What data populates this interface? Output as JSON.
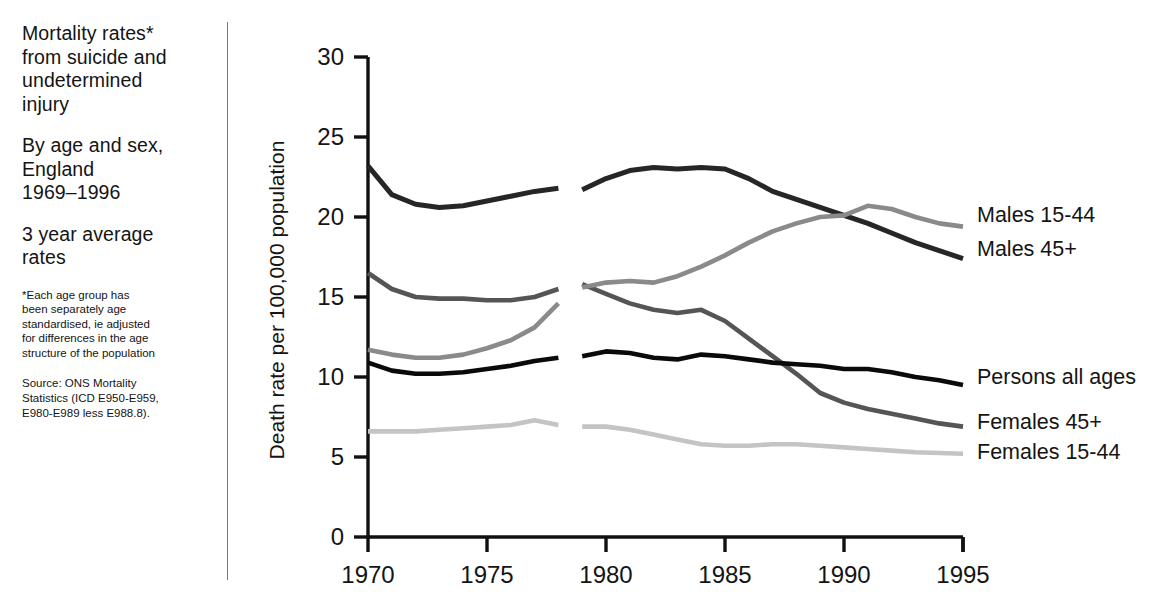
{
  "caption": {
    "title": "Mortality rates*\nfrom suicide and\nundetermined\ninjury",
    "subtitle": "By age and sex,\nEngland\n1969–1996",
    "note": "3 year average\nrates",
    "footnote_star": "*Each age group has\nbeen separately age\nstandardised, ie adjusted\nfor differences in the age\nstructure of the population",
    "footnote_source": "Source: ONS Mortality\nStatistics (ICD E950-E959,\nE980-E989 less E988.8)."
  },
  "chart_data": {
    "type": "line",
    "xlabel": "",
    "ylabel": "Death rate per 100,000 population",
    "xlim": [
      1969,
      1995.5
    ],
    "ylim": [
      0,
      30
    ],
    "xticks": [
      "1970",
      "1975",
      "1980",
      "1985",
      "1990",
      "1995"
    ],
    "xtick_values": [
      1970,
      1975,
      1980,
      1985,
      1990,
      1995
    ],
    "yticks": [
      "0",
      "5",
      "10",
      "15",
      "20",
      "25",
      "30"
    ],
    "ytick_values": [
      0,
      5,
      10,
      15,
      20,
      25,
      30
    ],
    "grid": false,
    "legend_position": "right-inline",
    "break_between": [
      1978.0,
      1978.9
    ],
    "series": [
      {
        "name": "Males 45+",
        "color": "#262626",
        "width": 5.0,
        "label_y": 18.0,
        "x": [
          1970,
          1971,
          1972,
          1973,
          1974,
          1975,
          1976,
          1977,
          1978,
          1979,
          1980,
          1981,
          1982,
          1983,
          1984,
          1985,
          1986,
          1987,
          1988,
          1989,
          1990,
          1991,
          1992,
          1993,
          1994,
          1995
        ],
        "values": [
          23.2,
          21.4,
          20.8,
          20.6,
          20.7,
          21.0,
          21.3,
          21.6,
          21.8,
          21.7,
          22.4,
          22.9,
          23.1,
          23.0,
          23.1,
          23.0,
          22.4,
          21.6,
          21.1,
          20.6,
          20.1,
          19.6,
          19.0,
          18.4,
          17.9,
          17.4
        ]
      },
      {
        "name": "Females 45+",
        "color": "#555555",
        "width": 4.6,
        "label_y": 7.2,
        "x": [
          1970,
          1971,
          1972,
          1973,
          1974,
          1975,
          1976,
          1977,
          1978,
          1979,
          1980,
          1981,
          1982,
          1983,
          1984,
          1985,
          1986,
          1987,
          1988,
          1989,
          1990,
          1991,
          1992,
          1993,
          1994,
          1995
        ],
        "values": [
          16.5,
          15.5,
          15.0,
          14.9,
          14.9,
          14.8,
          14.8,
          15.0,
          15.5,
          15.8,
          15.2,
          14.6,
          14.2,
          14.0,
          14.2,
          13.5,
          12.4,
          11.3,
          10.2,
          9.0,
          8.4,
          8.0,
          7.7,
          7.4,
          7.1,
          6.9
        ]
      },
      {
        "name": "Males 15-44",
        "color": "#8a8a8a",
        "width": 4.6,
        "label_y": 20.1,
        "x": [
          1970,
          1971,
          1972,
          1973,
          1974,
          1975,
          1976,
          1977,
          1978,
          1979,
          1980,
          1981,
          1982,
          1983,
          1984,
          1985,
          1986,
          1987,
          1988,
          1989,
          1990,
          1991,
          1992,
          1993,
          1994,
          1995
        ],
        "values": [
          11.7,
          11.4,
          11.2,
          11.2,
          11.4,
          11.8,
          12.3,
          13.1,
          14.6,
          15.6,
          15.9,
          16.0,
          15.9,
          16.3,
          16.9,
          17.6,
          18.4,
          19.1,
          19.6,
          20.0,
          20.1,
          20.7,
          20.5,
          20.0,
          19.6,
          19.4
        ]
      },
      {
        "name": "Persons all ages",
        "color": "#0a0a0a",
        "width": 4.6,
        "label_y": 10.0,
        "x": [
          1970,
          1971,
          1972,
          1973,
          1974,
          1975,
          1976,
          1977,
          1978,
          1979,
          1980,
          1981,
          1982,
          1983,
          1984,
          1985,
          1986,
          1987,
          1988,
          1989,
          1990,
          1991,
          1992,
          1993,
          1994,
          1995
        ],
        "values": [
          10.9,
          10.4,
          10.2,
          10.2,
          10.3,
          10.5,
          10.7,
          11.0,
          11.2,
          11.3,
          11.6,
          11.5,
          11.2,
          11.1,
          11.4,
          11.3,
          11.1,
          10.9,
          10.8,
          10.7,
          10.5,
          10.5,
          10.3,
          10.0,
          9.8,
          9.5
        ]
      },
      {
        "name": "Females 15-44",
        "color": "#c4c4c4",
        "width": 4.6,
        "label_y": 5.3,
        "x": [
          1970,
          1971,
          1972,
          1973,
          1974,
          1975,
          1976,
          1977,
          1978,
          1979,
          1980,
          1981,
          1982,
          1983,
          1984,
          1985,
          1986,
          1987,
          1988,
          1989,
          1990,
          1991,
          1992,
          1993,
          1994,
          1995
        ],
        "values": [
          6.6,
          6.6,
          6.6,
          6.7,
          6.8,
          6.9,
          7.0,
          7.3,
          7.0,
          6.9,
          6.9,
          6.7,
          6.4,
          6.1,
          5.8,
          5.7,
          5.7,
          5.8,
          5.8,
          5.7,
          5.6,
          5.5,
          5.4,
          5.3,
          5.25,
          5.2
        ]
      }
    ]
  }
}
